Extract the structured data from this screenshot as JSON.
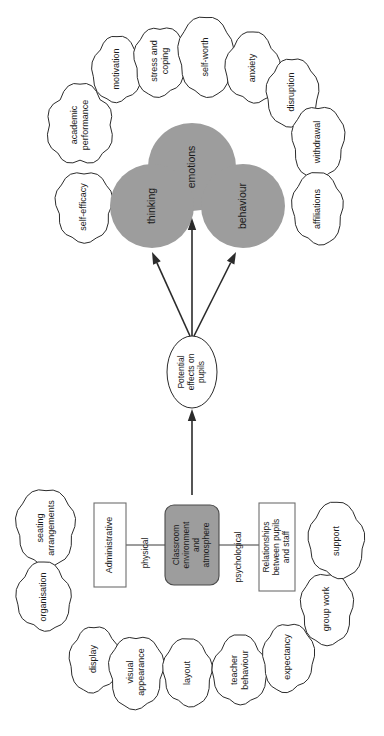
{
  "figure": {
    "orientation_degrees": -90,
    "colors": {
      "node_fill_gray": "#9d9d9d",
      "cloud_fill": "#ffffff",
      "stroke": "#2b2b2b",
      "background": "#ffffff"
    }
  },
  "core": {
    "center_box": "Classroom\nenvironment\nand\natmosphere",
    "center_box_lines": [
      "Classroom",
      "environment",
      "and",
      "atmosphere"
    ],
    "left_box": "Administrative",
    "right_box_lines": [
      "Relationships",
      "between pupils",
      "and staff"
    ],
    "left_branch_label": "physical",
    "right_branch_label": "psychological",
    "mediator_lines": [
      "Potential",
      "effects on",
      "pupils"
    ],
    "mediator": "Potential effects on pupils"
  },
  "outcome_circles": [
    {
      "id": "thinking",
      "label": "thinking"
    },
    {
      "id": "emotions",
      "label": "emotions"
    },
    {
      "id": "behaviour",
      "label": "behaviour"
    }
  ],
  "effect_clouds": [
    {
      "id": "self-efficacy",
      "lines": [
        "self-efficacy"
      ]
    },
    {
      "id": "academic-performance",
      "lines": [
        "academic",
        "performance"
      ]
    },
    {
      "id": "motivation",
      "lines": [
        "motivation"
      ]
    },
    {
      "id": "stress-and-coping",
      "lines": [
        "stress and",
        "coping"
      ]
    },
    {
      "id": "self-worth",
      "lines": [
        "self-worth"
      ]
    },
    {
      "id": "anxiety",
      "lines": [
        "anxiety"
      ]
    },
    {
      "id": "disruption",
      "lines": [
        "disruption"
      ]
    },
    {
      "id": "withdrawal",
      "lines": [
        "withdrawal"
      ]
    },
    {
      "id": "affiliations",
      "lines": [
        "affiliations"
      ]
    }
  ],
  "environment_clouds": [
    {
      "id": "seating-arrangements",
      "lines": [
        "seating",
        "arrangements"
      ]
    },
    {
      "id": "organisation",
      "lines": [
        "organisation"
      ]
    },
    {
      "id": "display",
      "lines": [
        "display"
      ]
    },
    {
      "id": "visual-appearance",
      "lines": [
        "visual",
        "appearance"
      ]
    },
    {
      "id": "layout",
      "lines": [
        "layout"
      ]
    },
    {
      "id": "teacher-behaviour",
      "lines": [
        "teacher",
        "behaviour"
      ]
    },
    {
      "id": "expectancy",
      "lines": [
        "expectancy"
      ]
    },
    {
      "id": "group-work",
      "lines": [
        "group work"
      ]
    },
    {
      "id": "support",
      "lines": [
        "support"
      ]
    }
  ]
}
